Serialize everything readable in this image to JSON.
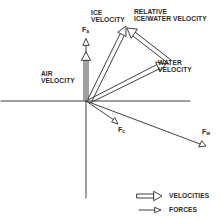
{
  "diagram": {
    "title": "",
    "labels": {
      "ice_velocity": [
        "ICE",
        "VELOCITY"
      ],
      "relative_velocity": [
        "RELATIVE",
        "ICE/WATER VELOCITY"
      ],
      "air_velocity": [
        "AIR",
        "VELOCITY"
      ],
      "water_velocity": [
        "WATER",
        "VELOCITY"
      ]
    },
    "forces": {
      "fa": {
        "symbol": "F",
        "sub": "a"
      },
      "fc": {
        "symbol": "F",
        "sub": "c"
      },
      "fw": {
        "symbol": "F",
        "sub": "w"
      }
    },
    "legend": {
      "velocities": "VELOCITIES",
      "forces": "FORCES"
    },
    "colors": {
      "ink": "#2a2a2a",
      "background": "#ffffff"
    }
  }
}
